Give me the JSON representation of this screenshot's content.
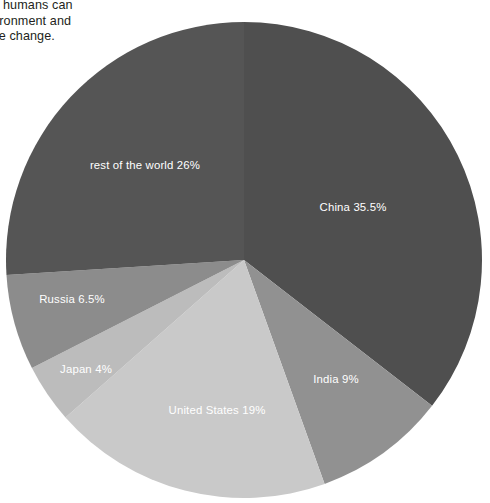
{
  "body_copy": {
    "line1": "f things humans can",
    "line2": "he environment and",
    "line3": "f climate change."
  },
  "chart_data": {
    "type": "pie",
    "title": "",
    "legend_position": "inside-slices",
    "grid": false,
    "start_angle_deg": 0,
    "direction": "clockwise",
    "center": {
      "x": 244,
      "y": 260
    },
    "radius": 238,
    "unit": "%",
    "categories": [
      "China",
      "India",
      "United States",
      "Japan",
      "Russia",
      "rest of the world"
    ],
    "values": [
      35.5,
      9,
      19,
      4,
      6.5,
      26
    ],
    "colors": [
      "#4f4f4f",
      "#919191",
      "#c9c9c9",
      "#bcbcbc",
      "#8c8c8c",
      "#555555"
    ],
    "slices": [
      {
        "name": "China",
        "label": "China 35.5%",
        "value": 35.5,
        "color": "#4f4f4f",
        "label_x": 353,
        "label_y": 211,
        "label_anchor": "middle"
      },
      {
        "name": "India",
        "label": "India 9%",
        "value": 9,
        "color": "#919191",
        "label_x": 336,
        "label_y": 383,
        "label_anchor": "middle"
      },
      {
        "name": "United States",
        "label": "United States 19%",
        "value": 19,
        "color": "#c9c9c9",
        "label_x": 217,
        "label_y": 414,
        "label_anchor": "middle"
      },
      {
        "name": "Japan",
        "label": "Japan 4%",
        "value": 4,
        "color": "#bcbcbc",
        "label_x": 86,
        "label_y": 373,
        "label_anchor": "middle"
      },
      {
        "name": "Russia",
        "label": "Russia 6.5%",
        "value": 6.5,
        "color": "#8c8c8c",
        "label_x": 72,
        "label_y": 303,
        "label_anchor": "middle"
      },
      {
        "name": "rest of the world",
        "label": "rest of the world 26%",
        "value": 26,
        "color": "#555555",
        "label_x": 145,
        "label_y": 169,
        "label_anchor": "middle"
      }
    ]
  }
}
